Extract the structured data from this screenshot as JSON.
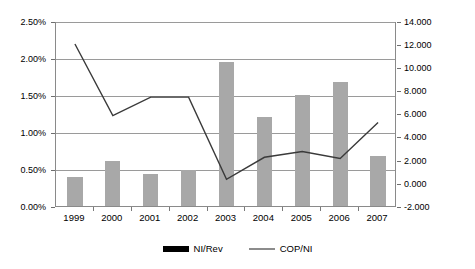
{
  "chart_data": {
    "type": "bar",
    "title": "",
    "subtitle": "",
    "xlabel": "",
    "ylabel": "",
    "categories": [
      "1999",
      "2000",
      "2001",
      "2002",
      "2003",
      "2004",
      "2005",
      "2006",
      "2007"
    ],
    "grid": true,
    "legend_position": "bottom",
    "axes": {
      "left": {
        "label": "",
        "ylim": [
          0.0,
          2.5
        ],
        "ticks": [
          0.0,
          0.5,
          1.0,
          1.5,
          2.0,
          2.5
        ],
        "tick_labels": [
          "0.00%",
          "0.50%",
          "1.00%",
          "1.50%",
          "2.00%",
          "2.50%"
        ],
        "format": "percent"
      },
      "right": {
        "label": "",
        "ylim": [
          -2.0,
          14.0
        ],
        "ticks": [
          -2.0,
          0.0,
          2.0,
          4.0,
          6.0,
          8.0,
          10.0,
          12.0,
          14.0
        ],
        "tick_labels": [
          "-2.000",
          "0.000",
          "2.000",
          "4.000",
          "6.000",
          "8.000",
          "10.000",
          "12.000",
          "14.000"
        ],
        "format": "decimal"
      }
    },
    "series": [
      {
        "name": "NI/Rev",
        "type": "bar",
        "axis": "left",
        "color": "#a8a8a8",
        "legend_swatch_color": "#000000",
        "values": [
          0.39,
          0.61,
          0.43,
          0.49,
          1.95,
          1.2,
          1.5,
          1.68,
          0.68
        ]
      },
      {
        "name": "COP/NI",
        "type": "line",
        "axis": "right",
        "color": "#3a3a3a",
        "legend_swatch_color": "#8c8c8c",
        "values": [
          12.1,
          5.9,
          7.5,
          7.5,
          0.4,
          2.3,
          2.8,
          2.2,
          5.3
        ]
      }
    ]
  },
  "legend": {
    "entries": [
      {
        "label": "NI/Rev"
      },
      {
        "label": "COP/NI"
      }
    ]
  }
}
